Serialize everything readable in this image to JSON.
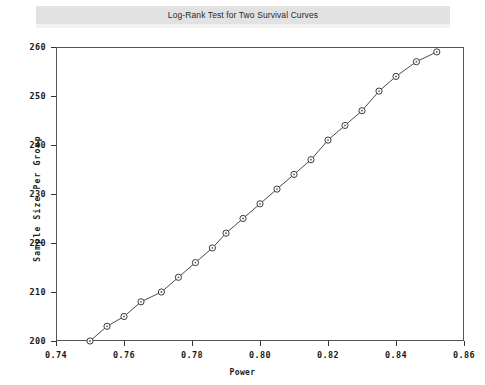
{
  "window": {
    "title": "Log-Rank Test for Two Survival Curves"
  },
  "chart_data": {
    "type": "line",
    "title": "Log-Rank Test for Two Survival Curves",
    "xlabel": "Power",
    "ylabel": "Sample Size Per Group",
    "xlim": [
      0.74,
      0.86
    ],
    "ylim": [
      200,
      260
    ],
    "xticks": [
      "0.74",
      "0.76",
      "0.78",
      "0.80",
      "0.82",
      "0.84",
      "0.86"
    ],
    "xtick_values": [
      0.74,
      0.76,
      0.78,
      0.8,
      0.82,
      0.84,
      0.86
    ],
    "yticks": [
      "200",
      "210",
      "220",
      "230",
      "240",
      "250",
      "260"
    ],
    "ytick_values": [
      200,
      210,
      220,
      230,
      240,
      250,
      260
    ],
    "grid": false,
    "legend": "none",
    "marker": "open-circle",
    "x": [
      0.75,
      0.755,
      0.76,
      0.765,
      0.771,
      0.776,
      0.781,
      0.786,
      0.79,
      0.795,
      0.8,
      0.805,
      0.81,
      0.815,
      0.82,
      0.825,
      0.83,
      0.835,
      0.84,
      0.846,
      0.852
    ],
    "values": [
      200,
      203,
      205,
      208,
      210,
      213,
      216,
      219,
      222,
      225,
      228,
      231,
      234,
      237,
      241,
      244,
      247,
      251,
      254,
      257,
      259
    ],
    "series": [
      {
        "name": "Sample Size Per Group",
        "values": [
          200,
          203,
          205,
          208,
          210,
          213,
          216,
          219,
          222,
          225,
          228,
          231,
          234,
          237,
          241,
          244,
          247,
          251,
          254,
          257,
          259
        ]
      }
    ]
  }
}
